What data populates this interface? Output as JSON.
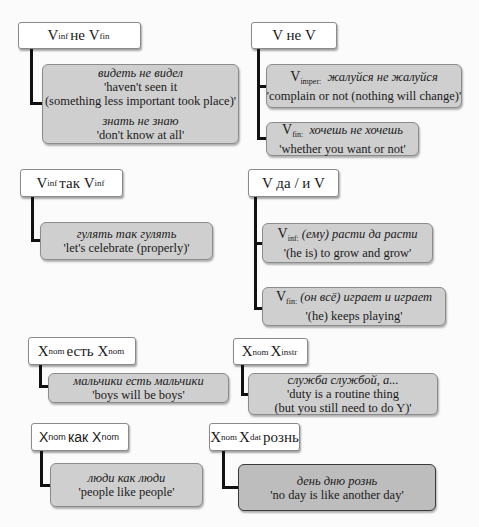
{
  "groups": [
    {
      "id": "vinf-ne-vfin",
      "header": {
        "base1": "V",
        "sub1": "inf",
        "mid": "не",
        "base2": "V",
        "sub2": "fin"
      },
      "examples": [
        {
          "lines": [
            {
              "text": "видеть не видел",
              "italic": true
            },
            {
              "text": "'haven't seen it"
            },
            {
              "text": "(something less important took place)'"
            },
            {
              "text": "знать не знаю",
              "italic": true
            },
            {
              "text": "'don't know at all'"
            }
          ]
        }
      ]
    },
    {
      "id": "v-ne-v",
      "header": {
        "text": "V не V"
      },
      "examples": [
        {
          "label_base": "V",
          "label_sub": "imper:",
          "phrase": "жалуйся не жалуйся",
          "gloss": "'complain or not (nothing will change)'"
        },
        {
          "label_base": "V",
          "label_sub": "fin:",
          "phrase": "хочешь не хочешь",
          "gloss": "'whether you want or not'"
        }
      ]
    },
    {
      "id": "vinf-tak-vinf",
      "header": {
        "base1": "V",
        "sub1": "inf",
        "mid": "так",
        "base2": "V",
        "sub2": "inf"
      },
      "examples": [
        {
          "phrase": "гулять так гулять",
          "gloss": "'let's celebrate (properly)'"
        }
      ]
    },
    {
      "id": "v-da-i-v",
      "header": {
        "text": "V да / и V"
      },
      "examples": [
        {
          "label_base": "V",
          "label_sub": "inf:",
          "phrase": "(ему) расти да расти",
          "gloss": "'(he is) to grow and grow'"
        },
        {
          "label_base": "V",
          "label_sub": "fin:",
          "phrase": "(он всё) играет и играет",
          "gloss": "'(he) keeps playing'"
        }
      ]
    },
    {
      "id": "xnom-est-xnom",
      "header": {
        "base1": "X",
        "sub1": "nom",
        "mid": "есть",
        "base2": "X",
        "sub2": "nom"
      },
      "examples": [
        {
          "phrase": "мальчики есть мальчики",
          "gloss": "'boys will be boys'"
        }
      ]
    },
    {
      "id": "xnom-xinstr",
      "header": {
        "base1": "X",
        "sub1": "nom",
        "mid": "",
        "base2": "X",
        "sub2": "instr"
      },
      "examples": [
        {
          "phrase": "служба службой, а...",
          "gloss": "'duty is a routine thing",
          "gloss2": "(but you still need to do Y)'"
        }
      ]
    },
    {
      "id": "xnom-kak-xnom",
      "header": {
        "base1": "X",
        "sub1": "nom",
        "mid": "как",
        "base2": "X",
        "sub2": "nom"
      },
      "examples": [
        {
          "phrase": "люди как люди",
          "gloss": "'people like people'"
        }
      ]
    },
    {
      "id": "xnom-xdat-rozn",
      "header": {
        "base1": "X",
        "sub1": "nom",
        "mid": "",
        "base2": "X",
        "sub2": "dat",
        "tail": "рознь"
      },
      "examples": [
        {
          "phrase": "день дню рознь",
          "gloss": "'no day is like another day'"
        }
      ]
    }
  ],
  "colors": {
    "header_fill": "#ffffff",
    "example_fill": "#cfcfcf",
    "example_fill_dark": "#bdbdbd",
    "connector": "#111111"
  }
}
